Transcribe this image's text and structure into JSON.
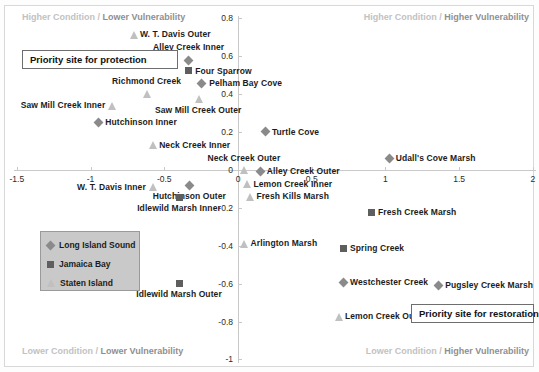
{
  "chart_data": {
    "type": "scatter",
    "title": "",
    "xlabel": "",
    "ylabel": "",
    "xlim": [
      -1.75,
      2.05
    ],
    "ylim": [
      -1.05,
      0.9
    ],
    "xticks": [
      -1.5,
      -1,
      -0.5,
      0,
      0.5,
      1,
      1.5,
      2
    ],
    "xtick_labels": [
      "-1.5",
      "-1",
      "-0.5",
      "0",
      "0.5",
      "1",
      "1.5",
      "2"
    ],
    "yticks": [
      0.8,
      0.6,
      0.4,
      0.2,
      0,
      -0.2,
      -0.4,
      -0.6,
      -0.8,
      -1
    ],
    "ytick_labels": [
      "0.8",
      "0.6",
      "0.4",
      "0.2",
      "0",
      "-0.2",
      "-0.4",
      "-0.6",
      "-0.8",
      "-1"
    ],
    "grid": false,
    "axes_cross_at": [
      0,
      0
    ],
    "series": [
      {
        "name": "Long Island Sound",
        "marker": "diamond",
        "color": "#8a8a8a",
        "points": [
          {
            "label": "Alley Creek Inner",
            "x": -0.335,
            "y": 0.575,
            "lx": -0.335,
            "ly": 0.645,
            "align": "center"
          },
          {
            "label": "Pelham Bay Cove",
            "x": -0.245,
            "y": 0.455,
            "lx": -0.195,
            "ly": 0.455,
            "align": "left"
          },
          {
            "label": "Hutchinson Inner",
            "x": -0.945,
            "y": 0.25,
            "lx": -0.9,
            "ly": 0.25,
            "align": "left"
          },
          {
            "label": "Turtle Cove",
            "x": 0.185,
            "y": 0.2,
            "lx": 0.23,
            "ly": 0.2,
            "align": "left"
          },
          {
            "label": "Udall's Cove Marsh",
            "x": 1.025,
            "y": 0.06,
            "lx": 1.07,
            "ly": 0.06,
            "align": "left"
          },
          {
            "label": "Alley Creek Outer",
            "x": 0.15,
            "y": -0.01,
            "lx": 0.195,
            "ly": -0.01,
            "align": "left"
          },
          {
            "label": "Hutchinson Outer",
            "x": -0.33,
            "y": -0.085,
            "lx": -0.33,
            "ly": -0.14,
            "align": "center"
          },
          {
            "label": "Westchester Creek",
            "x": 0.715,
            "y": -0.595,
            "lx": 0.76,
            "ly": -0.595,
            "align": "left"
          },
          {
            "label": "Pugsley Creek Marsh",
            "x": 1.36,
            "y": -0.61,
            "lx": 1.405,
            "ly": -0.61,
            "align": "left"
          }
        ]
      },
      {
        "name": "Jamaica Bay",
        "marker": "square",
        "color": "#5e5e5e",
        "points": [
          {
            "label": "Four Sparrow",
            "x": -0.335,
            "y": 0.52,
            "lx": -0.29,
            "ly": 0.52,
            "align": "left"
          },
          {
            "label": "Idlewild Marsh Inner",
            "x": -0.4,
            "y": -0.15,
            "lx": -0.4,
            "ly": -0.205,
            "align": "center"
          },
          {
            "label": "Fresh Creek Marsh",
            "x": 0.905,
            "y": -0.225,
            "lx": 0.95,
            "ly": -0.225,
            "align": "left"
          },
          {
            "label": "Spring Creek",
            "x": 0.715,
            "y": -0.415,
            "lx": 0.76,
            "ly": -0.415,
            "align": "left"
          },
          {
            "label": "Idlewild Marsh Outer",
            "x": -0.4,
            "y": -0.6,
            "lx": -0.4,
            "ly": -0.655,
            "align": "center"
          }
        ]
      },
      {
        "name": "Staten Island",
        "marker": "triangle",
        "color": "#c0c0c0",
        "points": [
          {
            "label": "W. T. Davis Outer",
            "x": -0.71,
            "y": 0.715,
            "lx": -0.665,
            "ly": 0.715,
            "align": "left"
          },
          {
            "label": "Richmond Creek",
            "x": -0.62,
            "y": 0.4,
            "lx": -0.62,
            "ly": 0.465,
            "align": "center"
          },
          {
            "label": "Saw Mill Creek Inner",
            "x": -0.855,
            "y": 0.34,
            "lx": -0.9,
            "ly": 0.34,
            "align": "right"
          },
          {
            "label": "Saw Mill Creek Outer",
            "x": -0.27,
            "y": 0.375,
            "lx": -0.27,
            "ly": 0.315,
            "align": "center"
          },
          {
            "label": "Neck Creek Inner",
            "x": -0.58,
            "y": 0.13,
            "lx": -0.535,
            "ly": 0.13,
            "align": "left"
          },
          {
            "label": "Neck Creek Outer",
            "x": 0.04,
            "y": 0.0,
            "lx": 0.04,
            "ly": 0.06,
            "align": "center"
          },
          {
            "label": "W. T. Davis Inner",
            "x": -0.58,
            "y": -0.09,
            "lx": -0.625,
            "ly": -0.09,
            "align": "right"
          },
          {
            "label": "Lemon Creek Inner",
            "x": 0.06,
            "y": -0.075,
            "lx": 0.105,
            "ly": -0.075,
            "align": "left"
          },
          {
            "label": "Fresh Kills Marsh",
            "x": 0.08,
            "y": -0.14,
            "lx": 0.125,
            "ly": -0.14,
            "align": "left"
          },
          {
            "label": "Arlington Marsh",
            "x": 0.04,
            "y": -0.39,
            "lx": 0.085,
            "ly": -0.39,
            "align": "left"
          },
          {
            "label": "Lemon Creek Outer",
            "x": 0.68,
            "y": -0.775,
            "lx": 0.725,
            "ly": -0.775,
            "align": "left"
          }
        ]
      }
    ],
    "quadrant_labels": [
      {
        "id": "top-left",
        "dim_text": "Higher Condition / ",
        "dark_text": "Lower Vulnerability"
      },
      {
        "id": "top-right",
        "dim_text": "Higher Condition / ",
        "dark_text": "Higher Vulnerability"
      },
      {
        "id": "bottom-left",
        "dim_text": "Lower Condition / ",
        "dark_text": "Lower Vulnerability"
      },
      {
        "id": "bottom-right",
        "dim_text": "Lower Condition / ",
        "dark_text": "Higher Vulnerability"
      }
    ],
    "annotations": [
      {
        "id": "protection",
        "text": "Priority site for protection"
      },
      {
        "id": "restoration",
        "text": "Priority site for restoration"
      }
    ],
    "legend": {
      "position": "lower-left",
      "entries": [
        {
          "label": "Long Island Sound",
          "marker": "diamond",
          "color": "#8a8a8a"
        },
        {
          "label": "Jamaica Bay",
          "marker": "square",
          "color": "#5e5e5e"
        },
        {
          "label": "Staten Island",
          "marker": "triangle",
          "color": "#c0c0c0"
        }
      ]
    }
  }
}
